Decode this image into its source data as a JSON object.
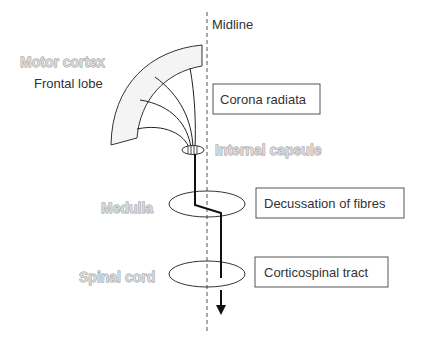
{
  "diagram": {
    "midline": {
      "label": "Midline"
    },
    "structures": {
      "motor_cortex": "Motor cortex",
      "frontal_lobe": "Frontal lobe",
      "internal_capsule": "Internal capsule",
      "medulla": "Medulla",
      "spinal_cord": "Spinal cord"
    },
    "boxes": {
      "corona_radiata": "Corona radiata",
      "decussation": "Decussation of fibres",
      "corticospinal_tract": "Corticospinal tract"
    },
    "colors": {
      "line": "#222222",
      "outline_text_fill": "#d8d8d8",
      "outline_text_stroke": "#8c8c8c",
      "box_border": "#555555",
      "cortex_fill": "#f4f4f4"
    }
  }
}
